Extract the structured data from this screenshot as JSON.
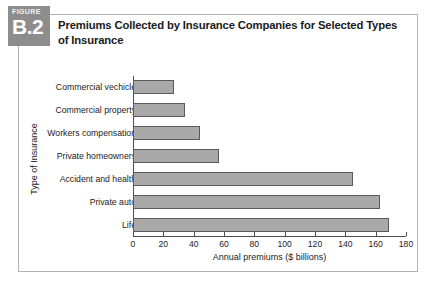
{
  "figure": {
    "word": "FIGURE",
    "number": "B.2",
    "title": "Premiums Collected by Insurance Companies for Selected Types of Insurance"
  },
  "colors": {
    "badge_bg": "#8d8d8d",
    "bar_fill": "#a9a9a9",
    "bar_border": "#5a5a5a",
    "frame_border": "#b3b3b3",
    "axis": "#4d4d4d"
  },
  "chart_data": {
    "type": "bar",
    "orientation": "horizontal",
    "title": "Premiums Collected by Insurance Companies for Selected Types of Insurance",
    "xlabel": "Annual premiums ($ billions)",
    "ylabel": "Type of Insurance",
    "categories": [
      "Commercial vechicle",
      "Commercial property",
      "Workers compensation",
      "Private homeowners",
      "Accident and health",
      "Private auto",
      "Life"
    ],
    "values": [
      27,
      34,
      44,
      57,
      145,
      163,
      169
    ],
    "xlim": [
      0,
      180
    ],
    "xticks": [
      0,
      20,
      40,
      60,
      80,
      100,
      120,
      140,
      160,
      180
    ],
    "xtick_labels": [
      "0",
      "20",
      "40",
      "60",
      "80",
      "100",
      "120",
      "140",
      "160",
      "180"
    ],
    "grid": false,
    "legend": false
  }
}
